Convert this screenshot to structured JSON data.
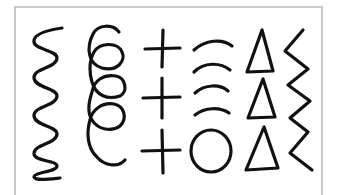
{
  "image": {
    "description": "Hand-drawn pre-writing stroke patterns inside a light gray frame",
    "frame_color": "#c8c8c8",
    "stroke_color": "#111111",
    "background": "#ffffff"
  },
  "patterns": [
    {
      "name": "wavy-line",
      "count": 1
    },
    {
      "name": "loops",
      "count": 4
    },
    {
      "name": "plus-signs",
      "count": 3
    },
    {
      "name": "arcs-and-circle",
      "arcs": 4,
      "circles": 1
    },
    {
      "name": "triangles",
      "count": 3
    },
    {
      "name": "zigzag-line",
      "count": 1
    }
  ]
}
